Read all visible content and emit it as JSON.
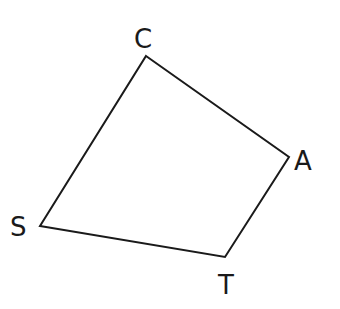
{
  "diagram": {
    "type": "quadrilateral",
    "vertices": [
      {
        "name": "C",
        "x": 146,
        "y": 56,
        "label_x": 134,
        "label_y": 48
      },
      {
        "name": "A",
        "x": 289,
        "y": 157,
        "label_x": 294,
        "label_y": 170
      },
      {
        "name": "T",
        "x": 225,
        "y": 257,
        "label_x": 218,
        "label_y": 294
      },
      {
        "name": "S",
        "x": 40,
        "y": 226,
        "label_x": 10,
        "label_y": 236
      }
    ],
    "edges": [
      [
        "C",
        "A"
      ],
      [
        "A",
        "T"
      ],
      [
        "T",
        "S"
      ],
      [
        "S",
        "C"
      ]
    ],
    "labels": {
      "C": "C",
      "A": "A",
      "T": "T",
      "S": "S"
    }
  }
}
